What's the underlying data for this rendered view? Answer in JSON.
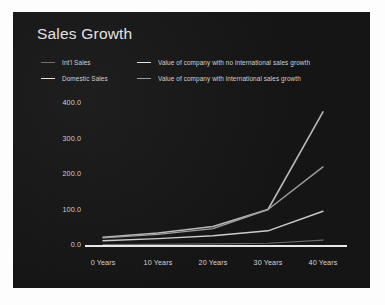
{
  "chart_data": {
    "type": "line",
    "title": "Sales Growth",
    "xlabel": "",
    "ylabel": "",
    "x": [
      0,
      10,
      20,
      30,
      40
    ],
    "categories": [
      "0 Years",
      "10 Years",
      "20 Years",
      "30 Years",
      "40 Years"
    ],
    "xticklabels": [
      "0  Years",
      "10 Years",
      "20 Years",
      "30 Years",
      "40 Years"
    ],
    "yticklabels": [
      "400.0",
      "300.0",
      "200.0",
      "100.0",
      "0.0"
    ],
    "ytickvalues": [
      400.0,
      300.0,
      200.0,
      100.0,
      0.0
    ],
    "ylim": [
      0,
      400
    ],
    "xlim": [
      0,
      40
    ],
    "grid": false,
    "legend_position": "top-left",
    "series": [
      {
        "name": "Value of company with international sales growth",
        "values": [
          22,
          34,
          52,
          100,
          375
        ],
        "color": "#b9b9b9",
        "width": 1.6
      },
      {
        "name": "Value of company with no international sales growth",
        "values": [
          20,
          30,
          46,
          100,
          220
        ],
        "color": "#9e9e9e",
        "width": 1.4
      },
      {
        "name": "Domestic Sales",
        "values": [
          12,
          18,
          26,
          40,
          95
        ],
        "color": "#cccccc",
        "width": 1.4
      },
      {
        "name": "Int'l Sales",
        "values": [
          1,
          2,
          3,
          5,
          14
        ],
        "color": "#6a6a6a",
        "width": 1.2
      }
    ],
    "baseline": {
      "value": 0,
      "color": "#e8e8e8",
      "width": 2
    }
  },
  "legend": {
    "rows": [
      {
        "left": {
          "label": "Int'l Sales",
          "swatch": "dim"
        },
        "right": {
          "label": "Value of company with no international sales growth",
          "swatch": "bright"
        }
      },
      {
        "left": {
          "label": "Domestic Sales",
          "swatch": "bright"
        },
        "right": {
          "label": "Value of company with international sales growth",
          "swatch": "mid"
        }
      }
    ]
  },
  "colors": {
    "panel_background": "#161616",
    "page_background": "#fdfdfd",
    "title_text": "#e3e3e3",
    "tick_text": "#d2d2d2",
    "axis_baseline": "#e8e8e8"
  }
}
